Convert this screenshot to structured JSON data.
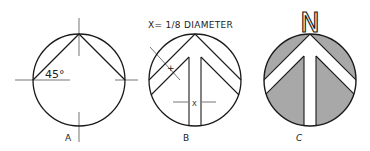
{
  "figures": [
    {
      "id": "A",
      "label": "A",
      "angle_label": "45°",
      "description": "Circle with center lines; two chords from top point at 45° to left and right points"
    },
    {
      "id": "B",
      "label": "B",
      "note": "X= 1/8 DIAMETER",
      "tick_label": "+",
      "dimension_label": "X",
      "description": "Circle with arrow/chevron construction lines; shaft width X"
    },
    {
      "id": "C",
      "label": "C",
      "north_letter": "N",
      "description": "Finished north arrow: shaded segments with white chevron and shaft"
    }
  ],
  "colors": {
    "ink": "#1a1a1a",
    "shade": "#a8a8a8",
    "paper": "#ffffff"
  }
}
